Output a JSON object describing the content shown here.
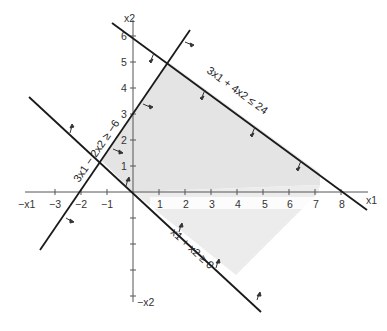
{
  "diagram": {
    "axes": {
      "x_label": "x1",
      "x_neg_label": "−x1",
      "y_label": "x2",
      "y_neg_label": "−x2",
      "x_ticks": [
        "−3",
        "−2",
        "−1",
        "1",
        "2",
        "3",
        "4",
        "5",
        "6",
        "7",
        "8"
      ],
      "y_ticks": [
        "1",
        "2",
        "3",
        "4",
        "5",
        "6"
      ]
    },
    "constraints": [
      {
        "id": "c1",
        "label": "3x1 + 4x2 ≤ 24"
      },
      {
        "id": "c2",
        "label": "3x1 − 2x2 ≥ −6"
      },
      {
        "id": "c3",
        "label": "x1 + x2 ≥ 0"
      }
    ],
    "colors": {
      "line": "#1a1a1a",
      "axis": "#555555",
      "shade": "#e4e4e4",
      "background": "#ffffff"
    }
  }
}
